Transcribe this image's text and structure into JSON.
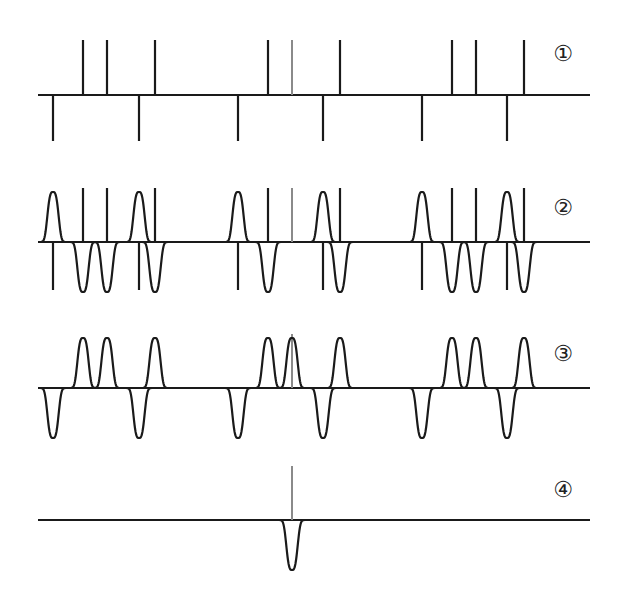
{
  "diagram": {
    "width": 622,
    "height": 605,
    "colors": {
      "line": "#1a1a1a",
      "reference": "#8a8a8a",
      "background": "#ffffff"
    },
    "baseline_x": [
      38,
      590
    ],
    "reference_x": 292,
    "rows": [
      {
        "id": "row-1",
        "label": "①",
        "label_pos": [
          563,
          60
        ],
        "baseline_y": 95,
        "kind": "spikes",
        "up_spikes": [
          83,
          107,
          155,
          268,
          340,
          452,
          476,
          524
        ],
        "down_spikes": [
          53,
          139,
          238,
          323,
          422,
          507
        ],
        "reference_spike": {
          "x": 292,
          "direction": "up"
        },
        "up_top": 40,
        "down_bottom": 141
      },
      {
        "id": "row-2",
        "label": "②",
        "label_pos": [
          563,
          214
        ],
        "baseline_y": 242,
        "kind": "spikes-and-bumps",
        "up_spikes": [
          83,
          107,
          155,
          268,
          340,
          452,
          476,
          524
        ],
        "down_spikes": [
          53,
          139,
          238,
          323,
          422,
          507
        ],
        "reference_spike": {
          "x": 292,
          "direction": "up"
        },
        "up_top": 188,
        "down_bottom": 290,
        "up_bumps": [
          53,
          139,
          238,
          323,
          422,
          507
        ],
        "down_bumps": [
          83,
          107,
          155,
          268,
          340,
          452,
          476,
          524
        ],
        "bump_height": 50
      },
      {
        "id": "row-3",
        "label": "③",
        "label_pos": [
          563,
          360
        ],
        "baseline_y": 388,
        "kind": "bumps",
        "up_bumps": [
          83,
          107,
          155,
          268,
          292,
          340,
          452,
          476,
          524
        ],
        "down_bumps": [
          53,
          139,
          238,
          323,
          422,
          507
        ],
        "reference_spike": {
          "x": 292,
          "direction": "up",
          "top": 334
        },
        "bump_height": 50
      },
      {
        "id": "row-4",
        "label": "④",
        "label_pos": [
          563,
          495
        ],
        "baseline_y": 520,
        "kind": "single",
        "up_bumps": [],
        "down_bumps": [
          292
        ],
        "reference_spike": {
          "x": 292,
          "direction": "up",
          "top": 466
        },
        "bump_height": 50
      }
    ]
  }
}
